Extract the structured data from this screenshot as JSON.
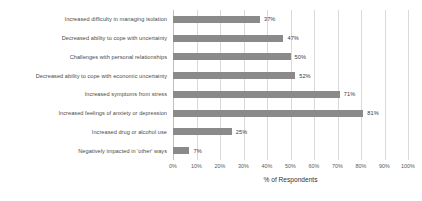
{
  "chart_data": {
    "type": "bar",
    "orientation": "horizontal",
    "title": "",
    "xlabel": "% of Respondents",
    "ylabel": "",
    "xlim": [
      0,
      100
    ],
    "grid": true,
    "legend": false,
    "value_suffix": "%",
    "categories": [
      "Increased difficulty in managing isolation",
      "Decreased ability to cope with uncertainty",
      "Challenges with personal relationships",
      "Decreased ability to cope with economic uncertainty",
      "Increased symptoms from stress",
      "Increased feelings of anxiety or depression",
      "Increased drug or alcohol use",
      "Negatively impacted in 'other' ways"
    ],
    "values": [
      37,
      47,
      50,
      52,
      71,
      81,
      25,
      7
    ],
    "value_labels": [
      "37%",
      "47%",
      "50%",
      "52%",
      "71%",
      "81%",
      "25%",
      "7%"
    ],
    "xticks": [
      0,
      10,
      20,
      30,
      40,
      50,
      60,
      70,
      80,
      90,
      100
    ],
    "xtick_labels": [
      "0%",
      "10%",
      "20%",
      "30%",
      "40%",
      "50%",
      "60%",
      "70%",
      "80%",
      "90%",
      "100%"
    ],
    "bar_color": "#8a8a8a",
    "grid_color": "#d9d9d9",
    "text_color": "#4a4a4a",
    "background": "#ffffff"
  }
}
